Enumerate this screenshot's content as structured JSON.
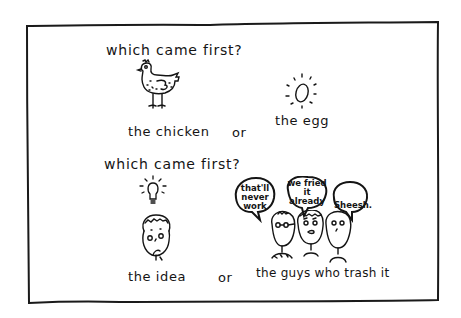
{
  "cartoon": {
    "panel_top": {
      "question": "which came first?",
      "option_a": "the chicken",
      "connector": "or",
      "option_b": "the egg",
      "icons": [
        "chicken-icon",
        "egg-icon"
      ]
    },
    "panel_bottom": {
      "question": "which came first?",
      "option_a": "the idea",
      "connector": "or",
      "option_b": "the guys who trash it",
      "icons": [
        "lightbulb-icon",
        "thinking-person-icon",
        "critics-group-icon"
      ],
      "speech_bubbles": [
        {
          "lines": [
            "that'll",
            "never",
            "work"
          ]
        },
        {
          "lines": [
            "we fried",
            "it",
            "already"
          ]
        },
        {
          "lines": [
            "Sheesh."
          ]
        }
      ]
    },
    "colors": {
      "ink": "#141414",
      "background": "#ffffff"
    }
  }
}
